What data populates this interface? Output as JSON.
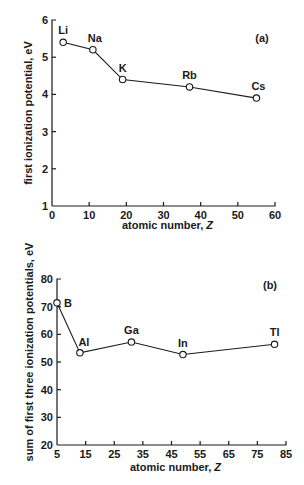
{
  "chart_data": [
    {
      "type": "line",
      "panel_label": "(a)",
      "title": "",
      "xlabel": "atomic number, Z",
      "ylabel": "first ionization potential, eV",
      "xlim": [
        0,
        60
      ],
      "ylim": [
        1,
        6
      ],
      "xticks": [
        0,
        10,
        20,
        30,
        40,
        50,
        60
      ],
      "yticks": [
        1,
        2,
        3,
        4,
        5,
        6
      ],
      "grid": false,
      "legend": null,
      "marker": "open-circle",
      "series": [
        {
          "name": "alkali metals",
          "points": [
            {
              "label": "Li",
              "x": 3,
              "y": 5.4
            },
            {
              "label": "Na",
              "x": 11,
              "y": 5.2
            },
            {
              "label": "K",
              "x": 19,
              "y": 4.4
            },
            {
              "label": "Rb",
              "x": 37,
              "y": 4.2
            },
            {
              "label": "Cs",
              "x": 55,
              "y": 3.9
            }
          ]
        }
      ]
    },
    {
      "type": "line",
      "panel_label": "(b)",
      "title": "",
      "xlabel": "atomic number, Z",
      "ylabel": "sum of first three ionization potentials, eV",
      "xlim": [
        5,
        85
      ],
      "ylim": [
        20,
        80
      ],
      "xticks": [
        5,
        15,
        25,
        35,
        45,
        55,
        65,
        75,
        85
      ],
      "yticks": [
        20,
        30,
        40,
        50,
        60,
        70,
        80
      ],
      "grid": false,
      "legend": null,
      "marker": "open-circle",
      "series": [
        {
          "name": "group 13 elements",
          "points": [
            {
              "label": "B",
              "x": 5,
              "y": 71.4
            },
            {
              "label": "Al",
              "x": 13,
              "y": 53.3
            },
            {
              "label": "Ga",
              "x": 31,
              "y": 57.2
            },
            {
              "label": "In",
              "x": 49,
              "y": 52.7
            },
            {
              "label": "Tl",
              "x": 81,
              "y": 56.4
            }
          ]
        }
      ]
    }
  ]
}
